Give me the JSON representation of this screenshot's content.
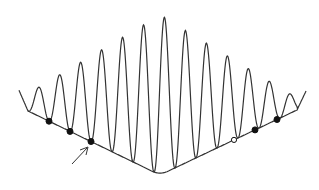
{
  "diagram": {
    "wave": {
      "peak_count": 14,
      "envelope": "triangular, maximum at center",
      "color": "#333333"
    },
    "baseline": {
      "shape": "V",
      "color": "#333333"
    },
    "markers": [
      {
        "side": "left",
        "index": 1,
        "style": "filled"
      },
      {
        "side": "left",
        "index": 2,
        "style": "filled"
      },
      {
        "side": "left",
        "index": 3,
        "style": "filled",
        "arrow": true
      },
      {
        "side": "right",
        "index": 3,
        "style": "open"
      },
      {
        "side": "right",
        "index": 2,
        "style": "filled"
      },
      {
        "side": "right",
        "index": 1,
        "style": "filled"
      }
    ],
    "marker_color": "#111111"
  }
}
